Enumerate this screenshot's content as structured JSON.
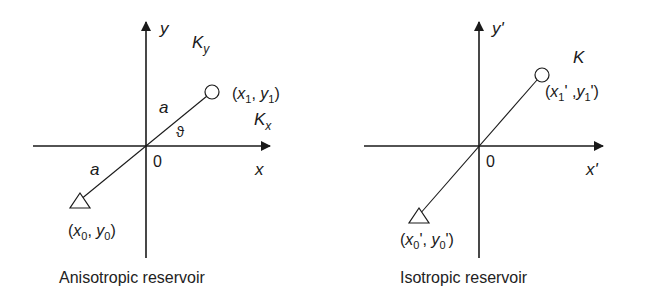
{
  "diagrams": [
    {
      "id": "anisotropic",
      "caption": "Anisotropic reservoir",
      "axis_y_label": "y",
      "axis_x_label": "x",
      "origin_label": "0",
      "perm_y_label": "K",
      "perm_y_sub": "y",
      "perm_x_label": "K",
      "perm_x_sub": "x",
      "point1": {
        "open": "(",
        "x": "x",
        "x_sub": "1",
        "sep": ", ",
        "y": "y",
        "y_sub": "1",
        "close": ")"
      },
      "point0": {
        "open": "(",
        "x": "x",
        "x_sub": "0",
        "sep": ", ",
        "y": "y",
        "y_sub": "0",
        "close": ")"
      },
      "dist_upper": "a",
      "dist_lower": "a",
      "angle_label": "ϑ"
    },
    {
      "id": "isotropic",
      "caption": "Isotropic reservoir",
      "axis_y_label": "y'",
      "axis_x_label": "x'",
      "origin_label": "0",
      "perm_label": "K",
      "point1": {
        "open": "(",
        "x": "x",
        "x_sub": "1",
        "x_prime": "'",
        "sep": " ,",
        "y": "y",
        "y_sub": "1",
        "y_prime": "'",
        "close": ")"
      },
      "point0": {
        "open": "(",
        "x": "x",
        "x_sub": "0",
        "x_prime": "'",
        "sep": ", ",
        "y": "y",
        "y_sub": "0",
        "y_prime": "'",
        "close": ")"
      }
    }
  ],
  "colors": {
    "ink": "#1a1a1a",
    "background": "#ffffff"
  }
}
